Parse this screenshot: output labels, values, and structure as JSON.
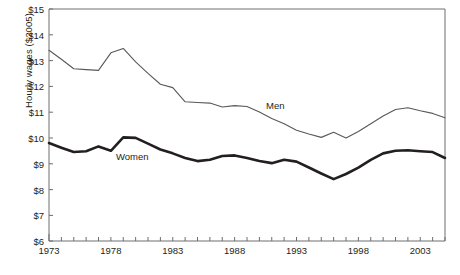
{
  "axes": {
    "ylabel": "Hourly wages ($2005)",
    "yticks": [
      "$15",
      "$14",
      "$13",
      "$12",
      "$11",
      "$10",
      "$9",
      "$8",
      "$7",
      "$6"
    ],
    "xticks": [
      "1973",
      "1978",
      "1983",
      "1988",
      "1993",
      "1998",
      "2003"
    ]
  },
  "labels": {
    "men": "Men",
    "women": "Women"
  },
  "colors": {
    "men_line": "#58595b",
    "women_line": "#231f20",
    "axis": "#6d6e71",
    "text": "#231f20",
    "background": "#ffffff"
  },
  "chart_data": {
    "type": "line",
    "title": "",
    "xlabel": "",
    "ylabel": "Hourly wages ($2005)",
    "xlim": [
      1973,
      2005
    ],
    "ylim": [
      6,
      15
    ],
    "grid": false,
    "legend": "inline-labels",
    "x": [
      1973,
      1974,
      1975,
      1976,
      1977,
      1978,
      1979,
      1980,
      1981,
      1982,
      1983,
      1984,
      1985,
      1986,
      1987,
      1988,
      1989,
      1990,
      1991,
      1992,
      1993,
      1994,
      1995,
      1996,
      1997,
      1998,
      1999,
      2000,
      2001,
      2002,
      2003,
      2004,
      2005
    ],
    "series": [
      {
        "name": "Men",
        "values": [
          13.4,
          13.05,
          12.68,
          12.65,
          12.62,
          13.3,
          13.47,
          12.95,
          12.5,
          12.08,
          11.95,
          11.4,
          11.37,
          11.35,
          11.2,
          11.25,
          11.22,
          11.0,
          10.75,
          10.55,
          10.3,
          10.15,
          10.02,
          10.22,
          10.0,
          10.25,
          10.55,
          10.85,
          11.1,
          11.17,
          11.05,
          10.95,
          10.78
        ]
      },
      {
        "name": "Women",
        "values": [
          9.8,
          9.62,
          9.45,
          9.48,
          9.67,
          9.5,
          10.02,
          10.0,
          9.78,
          9.55,
          9.4,
          9.22,
          9.1,
          9.15,
          9.3,
          9.32,
          9.22,
          9.1,
          9.02,
          9.15,
          9.08,
          8.85,
          8.62,
          8.4,
          8.6,
          8.85,
          9.15,
          9.4,
          9.5,
          9.52,
          9.48,
          9.45,
          9.22
        ]
      }
    ]
  }
}
